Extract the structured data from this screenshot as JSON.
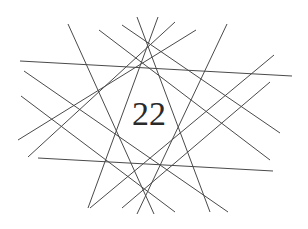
{
  "diagram": {
    "center_label": "22",
    "line_color": "#4a4a4a",
    "background": "#ffffff",
    "lines": [
      {
        "x1": 20,
        "y1": 61,
        "x2": 292,
        "y2": 76
      },
      {
        "x1": 38,
        "y1": 158,
        "x2": 273,
        "y2": 171
      },
      {
        "x1": 68,
        "y1": 24,
        "x2": 154,
        "y2": 214
      },
      {
        "x1": 227,
        "y1": 24,
        "x2": 137,
        "y2": 214
      },
      {
        "x1": 137,
        "y1": 17,
        "x2": 210,
        "y2": 212
      },
      {
        "x1": 158,
        "y1": 17,
        "x2": 88,
        "y2": 208
      },
      {
        "x1": 99,
        "y1": 30,
        "x2": 270,
        "y2": 160
      },
      {
        "x1": 122,
        "y1": 25,
        "x2": 280,
        "y2": 133
      },
      {
        "x1": 24,
        "y1": 71,
        "x2": 228,
        "y2": 212
      },
      {
        "x1": 21,
        "y1": 96,
        "x2": 175,
        "y2": 212
      },
      {
        "x1": 196,
        "y1": 30,
        "x2": 18,
        "y2": 140
      },
      {
        "x1": 175,
        "y1": 22,
        "x2": 28,
        "y2": 157
      },
      {
        "x1": 274,
        "y1": 55,
        "x2": 90,
        "y2": 208
      },
      {
        "x1": 270,
        "y1": 82,
        "x2": 122,
        "y2": 208
      }
    ]
  }
}
